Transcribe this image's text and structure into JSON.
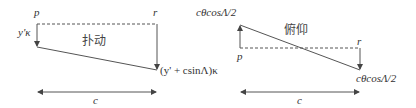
{
  "left_diagram": {
    "title": "扑动",
    "label_p": "p",
    "label_r": "r",
    "label_left": "y'κ",
    "label_bottom_right": "(y' + csinΛ)κ",
    "label_width": "c"
  },
  "right_diagram": {
    "title": "俯仰",
    "label_top_left": "cθcosΛ/2",
    "label_p": "p",
    "label_r": "r",
    "label_bottom_right": "cθcosΛ/2",
    "label_width": "c"
  }
}
